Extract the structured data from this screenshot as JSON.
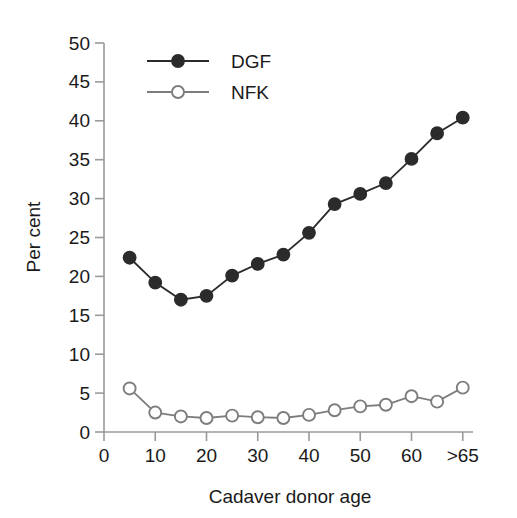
{
  "chart_data": {
    "type": "line",
    "title": "",
    "xlabel": "Cadaver donor age",
    "ylabel": "Per cent",
    "x": [
      5,
      10,
      15,
      20,
      25,
      30,
      35,
      40,
      45,
      50,
      55,
      60,
      65,
      70
    ],
    "x_tick_labels": [
      "0",
      "10",
      "20",
      "30",
      "40",
      "50",
      "60",
      ">65"
    ],
    "x_tick_values": [
      0,
      10,
      20,
      30,
      40,
      50,
      60,
      70
    ],
    "xlim": [
      0,
      72
    ],
    "y_tick_labels": [
      "0",
      "5",
      "10",
      "15",
      "20",
      "25",
      "30",
      "35",
      "40",
      "45",
      "50"
    ],
    "y_tick_values": [
      0,
      5,
      10,
      15,
      20,
      25,
      30,
      35,
      40,
      45,
      50
    ],
    "ylim": [
      0,
      50
    ],
    "grid": false,
    "legend_position": "top-left",
    "series": [
      {
        "name": "DGF",
        "marker": "filled-circle",
        "color": "#2b2b2b",
        "values": [
          22.4,
          19.2,
          17.0,
          17.5,
          20.1,
          21.6,
          22.8,
          25.6,
          29.3,
          30.6,
          32.0,
          35.1,
          38.4,
          40.4
        ]
      },
      {
        "name": "NFK",
        "marker": "open-circle",
        "color": "#7d7d7d",
        "values": [
          5.6,
          2.5,
          2.0,
          1.8,
          2.1,
          1.9,
          1.8,
          2.2,
          2.8,
          3.3,
          3.5,
          4.6,
          3.9,
          5.7
        ]
      }
    ]
  },
  "legend": {
    "entries": [
      {
        "label": "DGF"
      },
      {
        "label": "NFK"
      }
    ]
  },
  "colors": {
    "dgf": "#2b2b2b",
    "nfk": "#7d7d7d",
    "axis": "#9a9a9a",
    "text": "#1a1a1a",
    "background": "#ffffff"
  }
}
